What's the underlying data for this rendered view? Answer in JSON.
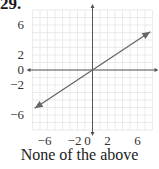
{
  "problem": {
    "number": "29."
  },
  "caption": "None of the above",
  "colors": {
    "grid": "#e6e6e6",
    "axis": "#555555",
    "line": "#666666",
    "text": "#333333"
  },
  "chart_data": {
    "type": "line",
    "title": "",
    "xlabel": "",
    "ylabel": "",
    "xlim": [
      -8,
      8
    ],
    "ylim": [
      -8,
      8
    ],
    "grid": true,
    "x_tick_labels": [
      "-6",
      "-2",
      "0",
      "2",
      "6"
    ],
    "y_tick_labels": [
      "6",
      "2",
      "0",
      "-2",
      "-6"
    ],
    "series": [
      {
        "name": "line",
        "x": [
          -7.7,
          7.7
        ],
        "y": [
          -5.1,
          5.1
        ],
        "equation": "y = (2/3)x",
        "arrows": "both ends"
      }
    ],
    "axes_arrows": true,
    "caption": "None of the above"
  }
}
